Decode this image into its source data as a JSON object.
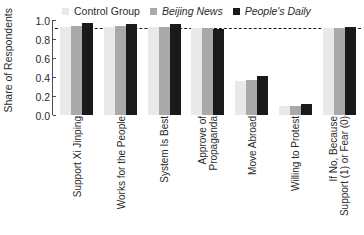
{
  "chart_data": {
    "type": "bar",
    "title": "",
    "subtitle": "",
    "xlabel": "",
    "ylabel": "Share of Respondents",
    "ylim": [
      0.0,
      1.0
    ],
    "yticks": [
      "0.0",
      "0.2",
      "0.4",
      "0.6",
      "0.8",
      "1.0"
    ],
    "ytick_values": [
      0.0,
      0.2,
      0.4,
      0.6,
      0.8,
      1.0
    ],
    "grid": false,
    "legend_position": "top",
    "reference_line": {
      "value": 0.92,
      "style": "dashed",
      "color": "#1a1a1a"
    },
    "categories": [
      "Support Xi Jinping",
      "Works for the People",
      "System Is Best",
      "Approve of Propaganda",
      "Move Abroad",
      "Willing to Protest",
      "If No, Because Support (1) or Fear (0)"
    ],
    "category_lines": [
      [
        "Support Xi Jinping"
      ],
      [
        "Works for the People"
      ],
      [
        "System Is Best"
      ],
      [
        "Approve of",
        "Propaganda"
      ],
      [
        "Move Abroad"
      ],
      [
        "Willing to Protest"
      ],
      [
        "If No, Because",
        "Support (1) or Fear (0)"
      ]
    ],
    "series": [
      {
        "name": "Control Group",
        "color": "#e9e9e9",
        "italic": false,
        "values": [
          0.93,
          0.93,
          0.93,
          0.92,
          0.36,
          0.09,
          0.92
        ]
      },
      {
        "name": "Beijing News",
        "color": "#a9a9a9",
        "italic": true,
        "values": [
          0.94,
          0.94,
          0.93,
          0.92,
          0.37,
          0.1,
          0.92
        ]
      },
      {
        "name": "People's Daily",
        "color": "#1a1a1a",
        "italic": true,
        "values": [
          0.97,
          0.96,
          0.96,
          0.91,
          0.41,
          0.12,
          0.93
        ]
      }
    ]
  }
}
